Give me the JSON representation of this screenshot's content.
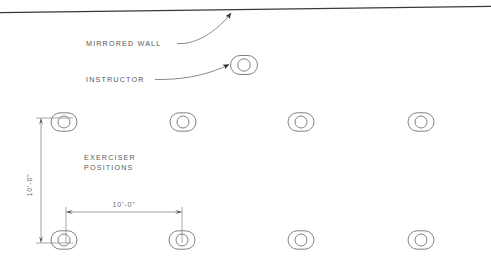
{
  "drawing": {
    "type": "architectural-floor-plan-fragment",
    "background_color": "#ffffff",
    "line_color": "#5a5a5a",
    "wall_color": "#3a3a3a",
    "text_color": "#555555"
  },
  "annotations": {
    "mirrored_wall_label": "MIRRORED WALL",
    "instructor_label": "INSTRUCTOR",
    "exerciser_label_line1": "EXERCISER",
    "exerciser_label_line2": "POSITIONS"
  },
  "dimensions": {
    "vertical_label": "10'-0\"",
    "horizontal_label": "10'-0\""
  },
  "symbols": {
    "instructor": {
      "cx": 244,
      "cy": 65,
      "rx": 13.5,
      "ry": 9.5,
      "inner_r": 6.2
    },
    "exercisers_row_top": [
      {
        "cx": 64,
        "cy": 122
      },
      {
        "cx": 183,
        "cy": 122
      },
      {
        "cx": 301,
        "cy": 122
      },
      {
        "cx": 421,
        "cy": 122
      }
    ],
    "exercisers_row_bottom": [
      {
        "cx": 64,
        "cy": 240
      },
      {
        "cx": 182,
        "cy": 240
      },
      {
        "cx": 301,
        "cy": 240
      },
      {
        "cx": 421,
        "cy": 240
      }
    ],
    "exerciser_rx": 13.0,
    "exerciser_ry": 9.2,
    "exerciser_inner_r": 6.0
  },
  "geometry": {
    "wall_line": {
      "x1": 0,
      "y1": 12.5,
      "x2": 491,
      "y2": 6.5
    },
    "vertical_dim_line": {
      "x": 41,
      "y1": 118,
      "y2": 243
    },
    "horizontal_dim_line": {
      "y": 212,
      "x1": 66,
      "x2": 182
    }
  }
}
